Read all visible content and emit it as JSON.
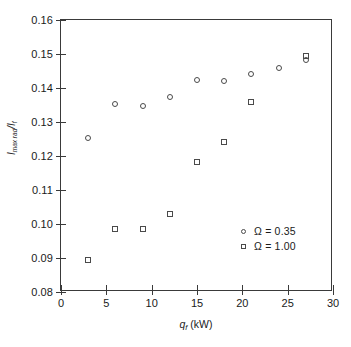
{
  "chart_data": {
    "type": "scatter",
    "title": "",
    "xlabel": "q_f (kW)",
    "ylabel": "I_max rad / I_f",
    "xlim": [
      0,
      30
    ],
    "ylim": [
      0.08,
      0.16
    ],
    "xticks": [
      "0",
      "5",
      "10",
      "15",
      "20",
      "25",
      "30"
    ],
    "xtick_values": [
      0,
      5,
      10,
      15,
      20,
      25,
      30
    ],
    "yticks": [
      "0.16",
      "0.15",
      "0.14",
      "0.13",
      "0.12",
      "0.11",
      "0.10",
      "0.09",
      "0.08"
    ],
    "ytick_values": [
      0.16,
      0.15,
      0.14,
      0.13,
      0.12,
      0.11,
      0.1,
      0.09,
      0.08
    ],
    "grid": false,
    "legend_position": "lower-right",
    "series": [
      {
        "name": "Ω = 0.35",
        "marker": "circle",
        "x": [
          3,
          6,
          9,
          12,
          15,
          18,
          21,
          24,
          27
        ],
        "y": [
          0.1253,
          0.1353,
          0.1348,
          0.1375,
          0.1425,
          0.142,
          0.144,
          0.146,
          0.1482
        ]
      },
      {
        "name": "Ω = 1.00",
        "marker": "square",
        "x": [
          3,
          6,
          9,
          12,
          15,
          18,
          21,
          27
        ],
        "y": [
          0.0894,
          0.0985,
          0.0985,
          0.1028,
          0.1183,
          0.1241,
          0.1359,
          0.1495
        ]
      }
    ]
  },
  "axes": {
    "x_title_main": "q",
    "x_title_sub": "f",
    "x_title_unit": " (kW)",
    "y_title_main": "I",
    "y_title_sub": "max rad",
    "y_title_slash": "/I",
    "y_title_sub2": "f"
  },
  "legend": {
    "entries": [
      {
        "label": "Ω = 0.35",
        "marker": "circle"
      },
      {
        "label": "Ω = 1.00",
        "marker": "square"
      }
    ]
  },
  "colors": {
    "axis": "#3a3a3a",
    "marker": "#4a4a4a",
    "text": "#1a1a1a",
    "background": "#ffffff"
  }
}
